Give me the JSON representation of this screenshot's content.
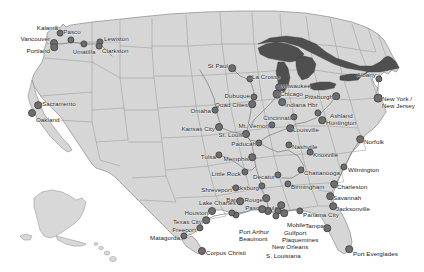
{
  "figure": {
    "width": 424,
    "height": 272
  },
  "colors": {
    "background": "#ffffff",
    "land": "#d6d6d6",
    "land_stroke": "#8a8a8a",
    "state_border": "#9a9a9a",
    "water": "#4f4f4f",
    "waterway": "#7a7a7a",
    "marker_fill": "#6e6e6e",
    "marker_stroke": "#4a4a4a",
    "label_text": "#1a1a1a"
  },
  "insets": [
    {
      "name": "alaska-inset",
      "label": ""
    },
    {
      "name": "hawaii-inset",
      "label": ""
    }
  ],
  "markers": [
    {
      "id": "kalama",
      "label": "Kalama",
      "x": 60,
      "y": 33,
      "r": 2.4,
      "lx": 58,
      "ly": 24,
      "align": "right"
    },
    {
      "id": "vancouver",
      "label": "Vancouver",
      "x": 54,
      "y": 43,
      "r": 3.0,
      "lx": 50,
      "ly": 35,
      "align": "right"
    },
    {
      "id": "portland",
      "label": "Portland",
      "x": 54,
      "y": 47,
      "r": 2.8,
      "lx": 50,
      "ly": 47,
      "align": "right"
    },
    {
      "id": "umatilla",
      "label": "Umatilla",
      "x": 84,
      "y": 44,
      "r": 2.6,
      "lx": 84,
      "ly": 48,
      "align": "center"
    },
    {
      "id": "pasco",
      "label": "Pasco",
      "x": 71,
      "y": 40,
      "r": 2.6,
      "lx": 72,
      "ly": 28,
      "align": "center"
    },
    {
      "id": "lewiston",
      "label": "Lewiston",
      "x": 100,
      "y": 42,
      "r": 2.6,
      "lx": 104,
      "ly": 35,
      "align": "left"
    },
    {
      "id": "clarkston",
      "label": "Clarkston",
      "x": 99,
      "y": 46,
      "r": 2.4,
      "lx": 102,
      "ly": 47,
      "align": "left"
    },
    {
      "id": "sacramento",
      "label": "Sacramento",
      "x": 38,
      "y": 105,
      "r": 2.8,
      "lx": 42,
      "ly": 100,
      "align": "left"
    },
    {
      "id": "oakland",
      "label": "Oakland",
      "x": 32,
      "y": 113,
      "r": 3.0,
      "lx": 36,
      "ly": 116,
      "align": "left"
    },
    {
      "id": "st-paul",
      "label": "St Paul",
      "x": 232,
      "y": 68,
      "r": 2.8,
      "lx": 228,
      "ly": 62,
      "align": "right"
    },
    {
      "id": "la-crosse",
      "label": "La Crosse",
      "x": 250,
      "y": 79,
      "r": 2.6,
      "lx": 252,
      "ly": 73,
      "align": "left"
    },
    {
      "id": "dubuque",
      "label": "Dubuque",
      "x": 254,
      "y": 97,
      "r": 2.6,
      "lx": 250,
      "ly": 92,
      "align": "right"
    },
    {
      "id": "quad-cities",
      "label": "Quad Cities",
      "x": 252,
      "y": 104,
      "r": 2.8,
      "lx": 248,
      "ly": 101,
      "align": "right"
    },
    {
      "id": "omaha",
      "label": "Omaha",
      "x": 215,
      "y": 110,
      "r": 2.4,
      "lx": 211,
      "ly": 107,
      "align": "right"
    },
    {
      "id": "kansas-city",
      "label": "Kansas City",
      "x": 219,
      "y": 127,
      "r": 3.0,
      "lx": 215,
      "ly": 125,
      "align": "right"
    },
    {
      "id": "milwaukee",
      "label": "Milwaukee",
      "x": 279,
      "y": 87,
      "r": 2.8,
      "lx": 281,
      "ly": 82,
      "align": "left"
    },
    {
      "id": "chicago",
      "label": "Chicago",
      "x": 277,
      "y": 94,
      "r": 3.4,
      "lx": 280,
      "ly": 90,
      "align": "left"
    },
    {
      "id": "indiana-hbr",
      "label": "Indiana Hbr",
      "x": 282,
      "y": 102,
      "r": 2.8,
      "lx": 285,
      "ly": 101,
      "align": "left"
    },
    {
      "id": "cincinnati",
      "label": "Cincinnati",
      "x": 294,
      "y": 117,
      "r": 2.6,
      "lx": 291,
      "ly": 114,
      "align": "right"
    },
    {
      "id": "mt-vernon",
      "label": "Mt. Vernon",
      "x": 272,
      "y": 125,
      "r": 2.6,
      "lx": 269,
      "ly": 122,
      "align": "right"
    },
    {
      "id": "louisville",
      "label": "Louisville",
      "x": 290,
      "y": 128,
      "r": 2.8,
      "lx": 293,
      "ly": 126,
      "align": "left"
    },
    {
      "id": "st-louis",
      "label": "St. Louis",
      "x": 246,
      "y": 134,
      "r": 3.0,
      "lx": 243,
      "ly": 131,
      "align": "right"
    },
    {
      "id": "paducah",
      "label": "Paducah",
      "x": 259,
      "y": 143,
      "r": 2.6,
      "lx": 256,
      "ly": 140,
      "align": "right"
    },
    {
      "id": "nashville",
      "label": "Nashville",
      "x": 289,
      "y": 145,
      "r": 2.6,
      "lx": 292,
      "ly": 143,
      "align": "left"
    },
    {
      "id": "memphis",
      "label": "Memphis",
      "x": 252,
      "y": 157,
      "r": 2.8,
      "lx": 249,
      "ly": 155,
      "align": "right"
    },
    {
      "id": "tulsa",
      "label": "Tulsa",
      "x": 219,
      "y": 155,
      "r": 2.6,
      "lx": 216,
      "ly": 153,
      "align": "right"
    },
    {
      "id": "little-rock",
      "label": "Little Rock",
      "x": 245,
      "y": 172,
      "r": 2.6,
      "lx": 241,
      "ly": 170,
      "align": "right"
    },
    {
      "id": "decatur",
      "label": "Decatur",
      "x": 278,
      "y": 175,
      "r": 2.6,
      "lx": 275,
      "ly": 173,
      "align": "right"
    },
    {
      "id": "knoxville",
      "label": "Knoxville",
      "x": 310,
      "y": 152,
      "r": 2.4,
      "lx": 313,
      "ly": 151,
      "align": "left"
    },
    {
      "id": "chattanooga",
      "label": "Chattanooga",
      "x": 301,
      "y": 170,
      "r": 2.6,
      "lx": 304,
      "ly": 169,
      "align": "left"
    },
    {
      "id": "birmingham",
      "label": "Birmingham",
      "x": 288,
      "y": 184,
      "r": 2.6,
      "lx": 291,
      "ly": 183,
      "align": "left"
    },
    {
      "id": "vicksburg",
      "label": "Vicksburg",
      "x": 262,
      "y": 186,
      "r": 2.6,
      "lx": 259,
      "ly": 184,
      "align": "right"
    },
    {
      "id": "shreveport",
      "label": "Shreveport",
      "x": 236,
      "y": 188,
      "r": 2.6,
      "lx": 232,
      "ly": 186,
      "align": "right"
    },
    {
      "id": "baton-rouge",
      "label": "Baton Rouge",
      "x": 266,
      "y": 198,
      "r": 2.8,
      "lx": 263,
      "ly": 196,
      "align": "right"
    },
    {
      "id": "pascagoula",
      "label": "Pascagoula",
      "x": 281,
      "y": 205,
      "r": 2.8,
      "lx": 278,
      "ly": 204,
      "align": "right"
    },
    {
      "id": "lake-charles",
      "label": "Lake Charles",
      "x": 240,
      "y": 201,
      "r": 2.8,
      "lx": 236,
      "ly": 199,
      "align": "right"
    },
    {
      "id": "houston",
      "label": "Houston",
      "x": 212,
      "y": 211,
      "r": 3.0,
      "lx": 208,
      "ly": 209,
      "align": "right"
    },
    {
      "id": "texas-city",
      "label": "Texas City",
      "x": 206,
      "y": 220,
      "r": 2.8,
      "lx": 202,
      "ly": 218,
      "align": "right"
    },
    {
      "id": "freeport",
      "label": "Freeport",
      "x": 200,
      "y": 228,
      "r": 2.6,
      "lx": 196,
      "ly": 226,
      "align": "right"
    },
    {
      "id": "matagorda",
      "label": "Matagorda",
      "x": 184,
      "y": 236,
      "r": 2.6,
      "lx": 180,
      "ly": 234,
      "align": "right"
    },
    {
      "id": "corpus-christi",
      "label": "Corpus Christi",
      "x": 202,
      "y": 251,
      "r": 3.0,
      "lx": 206,
      "ly": 249,
      "align": "left"
    },
    {
      "id": "port-arthur",
      "label": "Port Arthur",
      "x": 236,
      "y": 215,
      "r": 2.6,
      "lx": 239,
      "ly": 228,
      "align": "left"
    },
    {
      "id": "beaumont",
      "label": "Beaumont",
      "x": 232,
      "y": 213,
      "r": 2.6,
      "lx": 239,
      "ly": 235,
      "align": "left"
    },
    {
      "id": "mobile",
      "label": "Mobile",
      "x": 284,
      "y": 213,
      "r": 2.8,
      "lx": 287,
      "ly": 221,
      "align": "left"
    },
    {
      "id": "gulfport",
      "label": "Gulfport",
      "x": 278,
      "y": 211,
      "r": 2.6,
      "lx": 284,
      "ly": 229,
      "align": "left"
    },
    {
      "id": "plaquemines",
      "label": "Plaquemines",
      "x": 276,
      "y": 216,
      "r": 2.6,
      "lx": 282,
      "ly": 236,
      "align": "left"
    },
    {
      "id": "new-orleans",
      "label": "New Orleans",
      "x": 268,
      "y": 211,
      "r": 3.0,
      "lx": 272,
      "ly": 243,
      "align": "left"
    },
    {
      "id": "s-louisiana",
      "label": "S. Louisiana",
      "x": 262,
      "y": 209,
      "r": 2.8,
      "lx": 266,
      "ly": 252,
      "align": "left"
    },
    {
      "id": "panama-city",
      "label": "Panama City",
      "x": 300,
      "y": 211,
      "r": 2.6,
      "lx": 303,
      "ly": 211,
      "align": "left"
    },
    {
      "id": "tampa",
      "label": "Tampa",
      "x": 327,
      "y": 228,
      "r": 2.8,
      "lx": 324,
      "ly": 222,
      "align": "right"
    },
    {
      "id": "port-everglades",
      "label": "Port Everglades",
      "x": 349,
      "y": 249,
      "r": 2.8,
      "lx": 353,
      "ly": 250,
      "align": "left"
    },
    {
      "id": "jacksonville",
      "label": "Jacksonville",
      "x": 333,
      "y": 206,
      "r": 2.8,
      "lx": 336,
      "ly": 205,
      "align": "left"
    },
    {
      "id": "savannah",
      "label": "Savannah",
      "x": 330,
      "y": 196,
      "r": 2.8,
      "lx": 333,
      "ly": 194,
      "align": "left"
    },
    {
      "id": "charleston",
      "label": "Charleston",
      "x": 334,
      "y": 184,
      "r": 2.8,
      "lx": 337,
      "ly": 183,
      "align": "left"
    },
    {
      "id": "wilmington",
      "label": "Wilmington",
      "x": 344,
      "y": 167,
      "r": 2.6,
      "lx": 348,
      "ly": 166,
      "align": "left"
    },
    {
      "id": "norfolk",
      "label": "Norfolk",
      "x": 360,
      "y": 139,
      "r": 2.8,
      "lx": 364,
      "ly": 138,
      "align": "left"
    },
    {
      "id": "huntington",
      "label": "Huntington",
      "x": 322,
      "y": 120,
      "r": 2.8,
      "lx": 326,
      "ly": 119,
      "align": "left"
    },
    {
      "id": "ashland",
      "label": "Ashland",
      "x": 318,
      "y": 113,
      "r": 2.6,
      "lx": 330,
      "ly": 112,
      "align": "left"
    },
    {
      "id": "pittsburgh",
      "label": "Pittsburgh",
      "x": 336,
      "y": 96,
      "r": 2.8,
      "lx": 333,
      "ly": 93,
      "align": "right"
    },
    {
      "id": "albany",
      "label": "Albany",
      "x": 379,
      "y": 79,
      "r": 2.6,
      "lx": 376,
      "ly": 71,
      "align": "right"
    },
    {
      "id": "new-york-new-jersey",
      "label": "New York /\nNew Jersey",
      "x": 378,
      "y": 98,
      "r": 3.4,
      "lx": 382,
      "ly": 95,
      "align": "left"
    }
  ]
}
